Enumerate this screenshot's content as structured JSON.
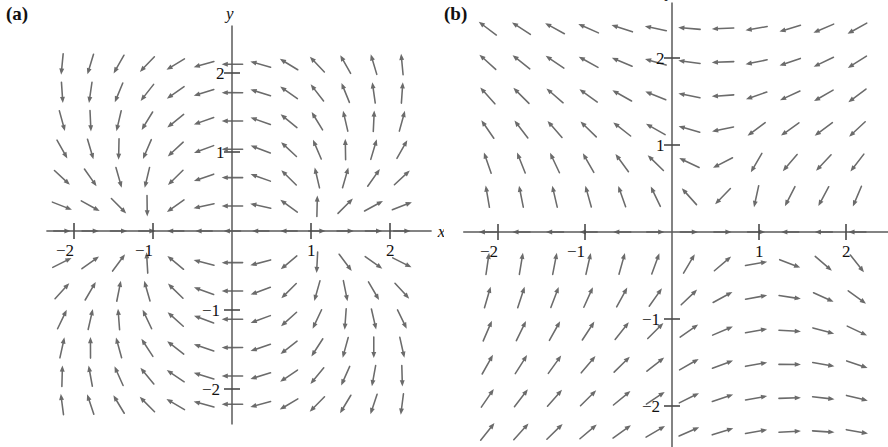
{
  "figure": {
    "background_color": "#ffffff",
    "arrow_color": "#6b6b6b",
    "axis_color": "#5a5a5a",
    "text_color": "#111111"
  },
  "panels": [
    {
      "key": "a",
      "label": "(a)",
      "origin_px": {
        "x": 232,
        "y": 231
      },
      "unit_px": 79,
      "x_axis_name": "x",
      "y_axis_name": "y",
      "x_ticks": [
        {
          "value": -2,
          "label": "−2"
        },
        {
          "value": -1,
          "label": "−1"
        },
        {
          "value": 1,
          "label": "1"
        },
        {
          "value": 2,
          "label": "2"
        }
      ],
      "y_ticks": [
        {
          "value": 2,
          "label": "2"
        },
        {
          "value": 1,
          "label": "1"
        },
        {
          "value": -1,
          "label": "−1"
        },
        {
          "value": -2,
          "label": "−2"
        }
      ],
      "axis_range": {
        "xmin": -2.35,
        "xmax": 2.35,
        "ymin": -2.45,
        "ymax": 2.45
      },
      "field": {
        "type": "sink-source-pair",
        "description": "Arrows converge toward (-1, 0) and diverge away from (1, 0)",
        "sink": {
          "x": -1,
          "y": 0
        },
        "source": {
          "x": 1,
          "y": 0
        }
      },
      "grid": {
        "x_start": -2.15,
        "x_step": 0.3586,
        "x_count": 13,
        "y_start": 2.11,
        "y_step": -0.3586,
        "y_count": 13
      },
      "arrow_len_px": 21
    },
    {
      "key": "b",
      "label": "(b)",
      "origin_px": {
        "x": 228,
        "y": 232
      },
      "unit_px": 87,
      "x_axis_name": "x",
      "y_axis_name": "y",
      "x_ticks": [
        {
          "value": -2,
          "label": "−2"
        },
        {
          "value": -1,
          "label": "−1"
        },
        {
          "value": 1,
          "label": "1"
        },
        {
          "value": 2,
          "label": "2"
        }
      ],
      "y_ticks": [
        {
          "value": 2,
          "label": "2"
        },
        {
          "value": 1,
          "label": "1"
        },
        {
          "value": -1,
          "label": "−1"
        },
        {
          "value": -2,
          "label": "−2"
        }
      ],
      "axis_range": {
        "xmin": -2.4,
        "xmax": 2.4,
        "ymin": -2.5,
        "ymax": 2.5
      },
      "field": {
        "type": "shear-rotational",
        "description": "Arrows point left-and-down above the x-axis and right-and-up below it; a vertical down-flow column sits near x = 1 above the axis",
        "center": {
          "x": 1,
          "y": 0
        }
      },
      "grid": {
        "x_start": -2.12,
        "x_step": 0.3862,
        "x_count": 12,
        "y_start": 2.34,
        "y_step": -0.3862,
        "y_count": 13
      },
      "arrow_len_px": 22
    }
  ]
}
